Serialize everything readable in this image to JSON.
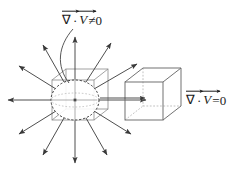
{
  "figure": {
    "background_color": "#ffffff",
    "stroke_color": "#3a3a3a",
    "text_color": "#1a1a1a",
    "width": 243,
    "height": 178
  },
  "labels": {
    "divergence_nonzero": {
      "nabla": "∇",
      "dot": "·",
      "field": "V",
      "relation": "≠0",
      "full_text": "∇⃗ · V⃗ ≠ 0",
      "description": "divergence-not-equal-zero-label"
    },
    "divergence_zero": {
      "nabla": "∇",
      "dot": "·",
      "field": "V",
      "relation": "=0",
      "full_text": "∇⃗ · V⃗ = 0",
      "description": "divergence-equals-zero-label"
    }
  },
  "diagram": {
    "source_region": {
      "name": "source-sphere",
      "center_x": 75,
      "center_y": 100,
      "radius_x": 24,
      "radius_y": 20,
      "style": "dashed",
      "center_dot": true,
      "box_around": {
        "front_x": 52,
        "front_y": 80,
        "front_w": 42,
        "front_h": 40,
        "depth_dx": 14,
        "depth_dy": -11
      }
    },
    "arrows": {
      "name": "radial-arrow-field",
      "count": 12,
      "angles_deg": [
        0,
        30,
        60,
        90,
        120,
        150,
        180,
        210,
        240,
        270,
        300,
        330
      ],
      "inner_radius": 22,
      "outer_radius": 72,
      "head_length": 6,
      "head_width": 4
    },
    "flux_cube": {
      "name": "solenoidal-cube",
      "front_x": 125,
      "front_y": 82,
      "front_w": 38,
      "front_h": 38,
      "depth_dx": 18,
      "depth_dy": -14,
      "hidden_edges": "dashed",
      "through_arrow": {
        "from_x": 102,
        "from_y": 98,
        "to_x": 144,
        "to_y": 98
      }
    },
    "pointer_leader": {
      "name": "label-leader-curve",
      "from_x": 73,
      "from_y": 28,
      "ctrl_x": 58,
      "ctrl_y": 58,
      "to_x": 69,
      "to_y": 82
    }
  }
}
